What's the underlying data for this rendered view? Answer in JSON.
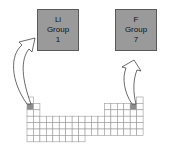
{
  "boxes": [
    {
      "symbol": "Li",
      "group_label": "Group",
      "group_number": "1"
    },
    {
      "symbol": "F",
      "group_label": "Group",
      "group_number": "7"
    }
  ],
  "grid": {
    "columns": 18,
    "rows": 7,
    "highlighted_cells": [
      {
        "row": 2,
        "col": 1,
        "element": "Li"
      },
      {
        "row": 2,
        "col": 17,
        "element": "F"
      }
    ]
  },
  "colors": {
    "box_fill": "#9a9a9a",
    "highlight_fill": "#8c8c8c",
    "grid_line": "#9a9a9a",
    "arrow_stroke": "#444444"
  }
}
